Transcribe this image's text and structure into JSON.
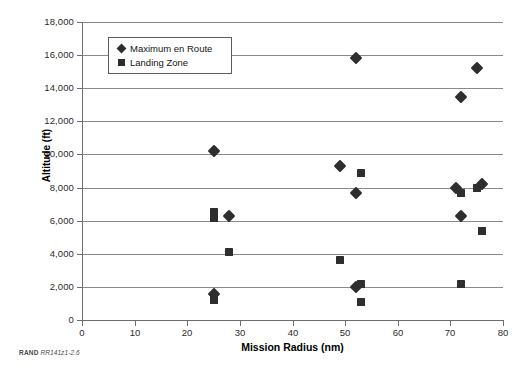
{
  "chart_data": {
    "type": "scatter",
    "title": "",
    "xlabel": "Mission Radius (nm)",
    "ylabel": "Altitude (ft)",
    "xlim": [
      0,
      80
    ],
    "ylim": [
      0,
      18000
    ],
    "xticks": [
      0,
      10,
      20,
      30,
      40,
      50,
      60,
      70,
      80
    ],
    "xtick_labels": [
      "0",
      "10",
      "20",
      "30",
      "40",
      "50",
      "60",
      "70",
      "80"
    ],
    "yticks": [
      0,
      2000,
      4000,
      6000,
      8000,
      10000,
      12000,
      14000,
      16000,
      18000
    ],
    "ytick_labels": [
      "0",
      "2,000",
      "4,000",
      "6,000",
      "8,000",
      "10,000",
      "12,000",
      "14,000",
      "16,000",
      "18,000"
    ],
    "grid": "horizontal",
    "legend_position": "upper-left-inside",
    "series": [
      {
        "name": "Maximum en Route",
        "marker": "diamond",
        "color": "#2e2e2e",
        "points": [
          {
            "x": 25,
            "y": 10200
          },
          {
            "x": 28,
            "y": 6300
          },
          {
            "x": 25,
            "y": 1600
          },
          {
            "x": 49,
            "y": 9300
          },
          {
            "x": 52,
            "y": 15800
          },
          {
            "x": 52,
            "y": 7700
          },
          {
            "x": 52,
            "y": 2000
          },
          {
            "x": 71,
            "y": 8000
          },
          {
            "x": 72,
            "y": 13500
          },
          {
            "x": 72,
            "y": 6300
          },
          {
            "x": 75,
            "y": 15200
          },
          {
            "x": 76,
            "y": 8200
          }
        ]
      },
      {
        "name": "Landing Zone",
        "marker": "square",
        "color": "#2e2e2e",
        "points": [
          {
            "x": 25,
            "y": 6550
          },
          {
            "x": 25,
            "y": 6150
          },
          {
            "x": 25,
            "y": 1200
          },
          {
            "x": 28,
            "y": 4100
          },
          {
            "x": 49,
            "y": 3650
          },
          {
            "x": 53,
            "y": 8900
          },
          {
            "x": 53,
            "y": 2200
          },
          {
            "x": 53,
            "y": 1100
          },
          {
            "x": 72,
            "y": 7650
          },
          {
            "x": 72,
            "y": 2200
          },
          {
            "x": 75,
            "y": 8000
          },
          {
            "x": 76,
            "y": 5400
          }
        ]
      }
    ]
  },
  "legend": {
    "items": [
      {
        "label": "Maximum en Route",
        "marker": "diamond"
      },
      {
        "label": "Landing Zone",
        "marker": "square"
      }
    ]
  },
  "caption": {
    "org": "RAND",
    "figure_id": "RR141z1-2.6"
  }
}
